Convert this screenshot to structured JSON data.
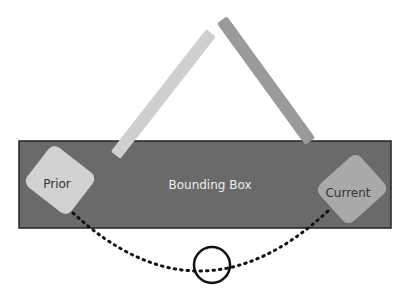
{
  "diagram": {
    "bounding_box": {
      "label": "Bounding Box",
      "color": "#6a6a6a"
    },
    "prior": {
      "label": "Prior",
      "handle_color": "#d2d2d2",
      "arm_color": "#cfcfcf"
    },
    "current": {
      "label": "Current",
      "handle_color": "#a9a9a9",
      "arm_color": "#9a9a9a"
    },
    "arc": {
      "style": "dotted",
      "color": "#111111"
    },
    "marker": {
      "shape": "circle",
      "color": "#111111"
    }
  }
}
